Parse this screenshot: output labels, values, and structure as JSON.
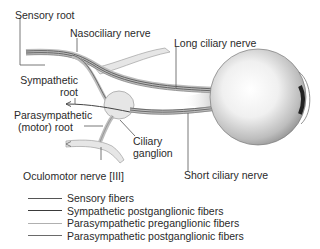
{
  "diagram": {
    "type": "anatomical-illustration",
    "labels": {
      "sensory_root": "Sensory root",
      "nasociliary_nerve": "Nasociliary nerve",
      "long_ciliary_nerve": "Long ciliary nerve",
      "sympathetic_root_line1": "Sympathetic",
      "sympathetic_root_line2": "root",
      "parasympathetic_root_line1": "Parasympathetic",
      "parasympathetic_root_line2": "(motor) root",
      "ciliary_ganglion_line1": "Ciliary",
      "ciliary_ganglion_line2": "ganglion",
      "oculomotor_nerve": "Oculomotor nerve [III]",
      "short_ciliary_nerve": "Short ciliary nerve"
    },
    "legend": [
      {
        "label": "Sensory fibers",
        "color": "#555555"
      },
      {
        "label": "Sympathetic postganglionic fibers",
        "color": "#3a3a3a"
      },
      {
        "label": "Parasympathetic preganglionic fibers",
        "color": "#b0b0b0"
      },
      {
        "label": "Parasympathetic postganglionic fibers",
        "color": "#6a6a6a"
      }
    ],
    "colors": {
      "nerve_fill": "#e6e6e6",
      "nerve_outline": "#9a9a9a",
      "ganglion_fill": "#e4e4e4",
      "eyeball_light": "#ffffff",
      "eyeball_dark": "#8a8a8a"
    }
  }
}
